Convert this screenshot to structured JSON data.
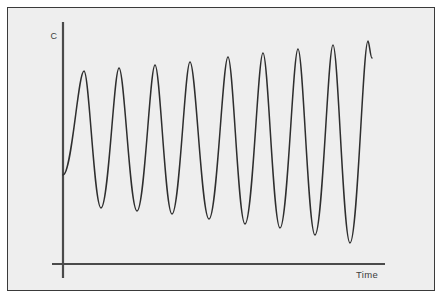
{
  "figure": {
    "background_color": "#eeeeee",
    "page_color": "#ffffff",
    "border_color": "#3a3a3a",
    "curve_color": "#2e2e2e",
    "axis_color": "#4a4a4a"
  },
  "axes": {
    "y_label": "C",
    "x_label": "Time"
  },
  "chart_data": {
    "type": "line",
    "title": "",
    "subtitle": "",
    "xlabel": "Time",
    "ylabel": "C",
    "grid": false,
    "legend": null,
    "annotations": [],
    "xlim": [
      0,
      1
    ],
    "ylim": [
      0,
      1
    ],
    "x_tick_labels": [],
    "y_tick_labels": [],
    "n_cycles": 9,
    "peaks": {
      "x": [
        84,
        119,
        155,
        190,
        228,
        263,
        298,
        333,
        368
      ],
      "y": [
        71,
        68,
        65,
        62,
        57,
        53,
        49,
        45,
        41
      ]
    },
    "troughs": {
      "x": [
        101,
        137,
        172,
        209,
        245,
        280,
        315,
        350
      ],
      "y": [
        208,
        211,
        214,
        219,
        224,
        228,
        235,
        243
      ]
    },
    "start_point": {
      "x": 63,
      "y": 175
    },
    "end_point": {
      "x": 372,
      "y": 58
    },
    "series": [
      {
        "name": "C(t)",
        "x": [
          63,
          84,
          101,
          119,
          137,
          155,
          172,
          190,
          209,
          228,
          245,
          263,
          280,
          298,
          315,
          333,
          350,
          368,
          372
        ],
        "values": [
          175,
          71,
          208,
          68,
          211,
          65,
          214,
          62,
          219,
          57,
          224,
          53,
          228,
          49,
          235,
          45,
          243,
          41,
          58
        ]
      }
    ]
  }
}
